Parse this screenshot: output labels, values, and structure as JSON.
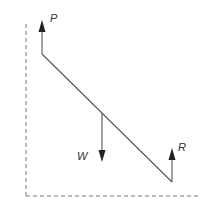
{
  "diagram": {
    "type": "force-diagram",
    "colors": {
      "line": "#555555",
      "arrow": "#222222",
      "dashed": "#777777",
      "label": "#333333"
    },
    "forces": [
      {
        "name": "P",
        "label": "P",
        "direction": "up",
        "point": "top end of beam"
      },
      {
        "name": "W",
        "label": "W",
        "direction": "down",
        "point": "middle of beam"
      },
      {
        "name": "R",
        "label": "R",
        "direction": "up",
        "point": "bottom end of beam"
      }
    ],
    "boundaries": [
      {
        "name": "wall",
        "style": "dashed",
        "orientation": "vertical"
      },
      {
        "name": "ground",
        "style": "dashed",
        "orientation": "horizontal"
      }
    ]
  }
}
